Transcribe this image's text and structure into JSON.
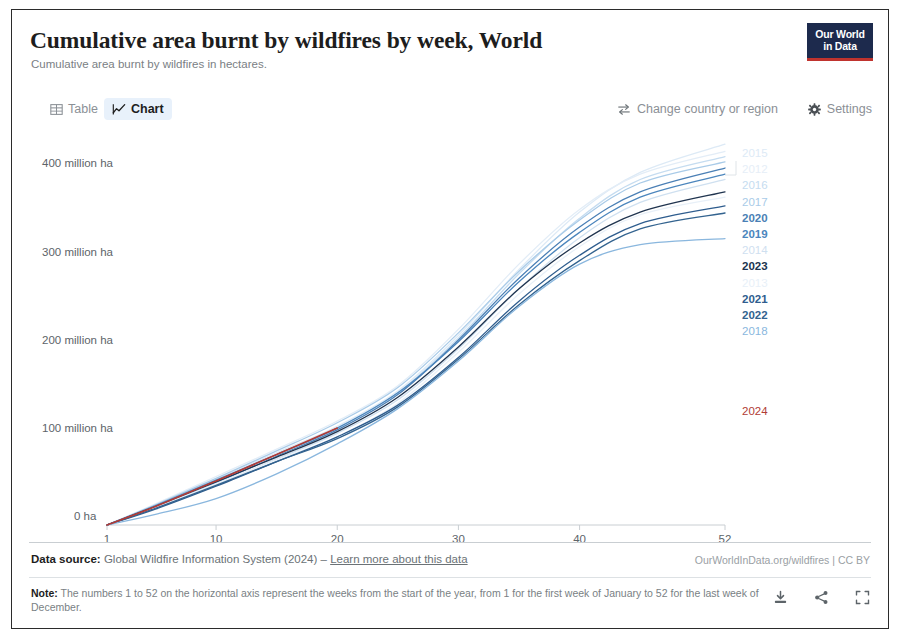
{
  "header": {
    "title": "Cumulative area burnt by wildfires by week, World",
    "subtitle": "Cumulative area burnt by wildfires in hectares.",
    "logo_line1": "Our World",
    "logo_line2": "in Data"
  },
  "tabs": [
    {
      "label": "Table",
      "icon": "table-icon",
      "active": false
    },
    {
      "label": "Chart",
      "icon": "chart-icon",
      "active": true
    }
  ],
  "controls": [
    {
      "label": "Change country or region",
      "icon": "swap-arrows-icon"
    },
    {
      "label": "Settings",
      "icon": "gear-icon"
    }
  ],
  "footer": {
    "source_prefix": "Data source:",
    "source_text": "Global Wildfire Information System (2024)",
    "source_dash": "–",
    "source_link": "Learn more about this data",
    "owid_url": "OurWorldInData.org/wildfires | CC BY",
    "note_prefix": "Note:",
    "note_text": "The numbers 1 to 52 on the horizontal axis represent the weeks from the start of the year, from 1 for the first week of January to 52 for the last week of December.",
    "actions": [
      {
        "name": "download-icon"
      },
      {
        "name": "share-icon"
      },
      {
        "name": "expand-icon"
      }
    ]
  },
  "chart_data": {
    "type": "line",
    "title": "Cumulative area burnt by wildfires by week, World",
    "subtitle": "Cumulative area burnt by wildfires in hectares.",
    "xlabel": "",
    "ylabel": "",
    "grid": false,
    "legend_position": "right",
    "x": [
      1,
      5,
      10,
      15,
      20,
      25,
      30,
      35,
      40,
      45,
      52
    ],
    "xticks": [
      "1",
      "10",
      "20",
      "30",
      "40",
      "52"
    ],
    "xtick_values": [
      1,
      10,
      20,
      30,
      40,
      52
    ],
    "xlim": [
      1,
      52
    ],
    "yticks": [
      "0 ha",
      "100 million ha",
      "200 million ha",
      "300 million ha",
      "400 million ha"
    ],
    "ytick_values": [
      0,
      100,
      200,
      300,
      400
    ],
    "ylim": [
      0,
      430
    ],
    "y_unit": "million ha",
    "highlight_series": "2024",
    "series": [
      {
        "name": "2015",
        "color": "#ddeaf6",
        "values": [
          0,
          22,
          52,
          82,
          112,
          152,
          215,
          290,
          355,
          400,
          432
        ]
      },
      {
        "name": "2012",
        "color": "#e3edf7",
        "values": [
          0,
          24,
          55,
          86,
          118,
          158,
          222,
          296,
          358,
          398,
          424
        ]
      },
      {
        "name": "2016",
        "color": "#c5dcf0",
        "values": [
          0,
          21,
          50,
          80,
          110,
          150,
          212,
          285,
          348,
          392,
          418
        ]
      },
      {
        "name": "2017",
        "color": "#a9cbe8",
        "values": [
          0,
          23,
          53,
          84,
          116,
          156,
          218,
          288,
          346,
          388,
          412
        ]
      },
      {
        "name": "2020",
        "color": "#4a7fb5",
        "values": [
          0,
          20,
          48,
          78,
          108,
          148,
          210,
          280,
          338,
          378,
          405
        ]
      },
      {
        "name": "2019",
        "color": "#4c86bd",
        "values": [
          0,
          22,
          51,
          80,
          110,
          150,
          208,
          276,
          332,
          372,
          398
        ]
      },
      {
        "name": "2014",
        "color": "#cfe0f0",
        "values": [
          0,
          19,
          46,
          75,
          104,
          142,
          200,
          268,
          326,
          366,
          392
        ]
      },
      {
        "name": "2023",
        "color": "#20344f",
        "values": [
          0,
          21,
          49,
          77,
          106,
          145,
          202,
          268,
          320,
          355,
          378
        ]
      },
      {
        "name": "2013",
        "color": "#e8f0f8",
        "values": [
          0,
          20,
          47,
          74,
          100,
          138,
          196,
          262,
          316,
          352,
          372
        ]
      },
      {
        "name": "2021",
        "color": "#2f5d8e",
        "values": [
          0,
          18,
          44,
          72,
          100,
          136,
          190,
          254,
          306,
          342,
          362
        ]
      },
      {
        "name": "2022",
        "color": "#33638f",
        "values": [
          0,
          19,
          45,
          72,
          98,
          134,
          188,
          250,
          300,
          336,
          354
        ]
      },
      {
        "name": "2018",
        "color": "#8ab7de",
        "values": [
          0,
          12,
          30,
          58,
          92,
          132,
          186,
          248,
          296,
          318,
          325
        ]
      },
      {
        "name": "2024",
        "color": "#b13b36",
        "values": [
          0,
          21,
          50,
          80,
          110,
          null,
          null,
          null,
          null,
          null,
          null
        ]
      }
    ],
    "legend_entries": [
      {
        "label": "2015",
        "color": "#ddeaf6"
      },
      {
        "label": "2012",
        "color": "#e6eef7"
      },
      {
        "label": "2016",
        "color": "#c5dcf0"
      },
      {
        "label": "2017",
        "color": "#a9cbe8"
      },
      {
        "label": "2020",
        "color": "#4a7fb5"
      },
      {
        "label": "2019",
        "color": "#4c86bd"
      },
      {
        "label": "2014",
        "color": "#cfe0f0"
      },
      {
        "label": "2023",
        "color": "#20344f"
      },
      {
        "label": "2013",
        "color": "#e8f0f8"
      },
      {
        "label": "2021",
        "color": "#2f5d8e"
      },
      {
        "label": "2022",
        "color": "#33638f"
      },
      {
        "label": "2018",
        "color": "#8ab7de"
      },
      {
        "label": "2024",
        "color": "#b13b36"
      }
    ]
  }
}
